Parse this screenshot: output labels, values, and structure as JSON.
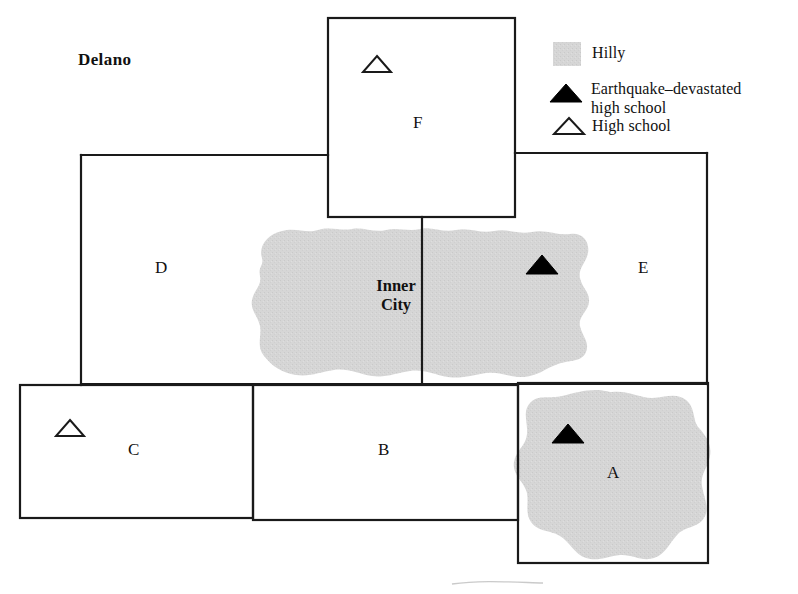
{
  "figure": {
    "title_label": "Delano",
    "inner_city_label": "Inner\nCity"
  },
  "regions": [
    {
      "id": "A",
      "label": "A",
      "hilly": true,
      "x": 612,
      "y": 473
    },
    {
      "id": "B",
      "label": "B",
      "hilly": false,
      "x": 383,
      "y": 449
    },
    {
      "id": "C",
      "label": "C",
      "hilly": false,
      "x": 133,
      "y": 449
    },
    {
      "id": "D",
      "label": "D",
      "hilly": false,
      "x": 160,
      "y": 267
    },
    {
      "id": "E",
      "label": "E",
      "hilly": false,
      "x": 643,
      "y": 267
    },
    {
      "id": "F",
      "label": "F",
      "hilly": false,
      "x": 418,
      "y": 122
    }
  ],
  "markers": [
    {
      "kind": "high-school",
      "region": "F",
      "x": 377,
      "y": 66
    },
    {
      "kind": "high-school",
      "region": "C",
      "x": 70,
      "y": 429
    },
    {
      "kind": "earthquake-devastated",
      "region": "E",
      "x": 542,
      "y": 265
    },
    {
      "kind": "earthquake-devastated",
      "region": "A",
      "x": 568,
      "y": 434
    }
  ],
  "legend": {
    "items": [
      {
        "symbol": "hilly-swatch",
        "label": "Hilly"
      },
      {
        "symbol": "filled-triangle",
        "label": "Earthquake–devastated\nhigh school"
      },
      {
        "symbol": "outline-triangle",
        "label": "High school"
      }
    ]
  },
  "colors": {
    "hilly_fill": "#d6d6d6",
    "line": "#1a1a1a",
    "text": "#111111",
    "marker_filled": "#000000",
    "marker_outline": "#ffffff",
    "background": "#ffffff"
  }
}
